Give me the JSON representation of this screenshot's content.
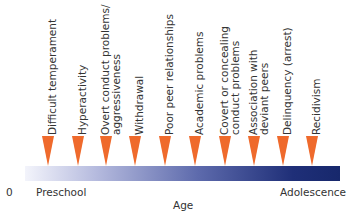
{
  "diagram": {
    "title": "",
    "events": [
      {
        "lines": [
          "Difficult temperament"
        ],
        "x": 48
      },
      {
        "lines": [
          "Hyperactivity"
        ],
        "x": 78
      },
      {
        "lines": [
          "Overt conduct problems/",
          "aggressiveness"
        ],
        "x": 106
      },
      {
        "lines": [
          "Withdrawal"
        ],
        "x": 135
      },
      {
        "lines": [
          "Poor peer relationships"
        ],
        "x": 165
      },
      {
        "lines": [
          "Academic problems"
        ],
        "x": 195
      },
      {
        "lines": [
          "Covert or concealing",
          "conduct problems"
        ],
        "x": 225
      },
      {
        "lines": [
          "Association with",
          "deviant peers"
        ],
        "x": 254
      },
      {
        "lines": [
          "Delinquency (arrest)"
        ],
        "x": 283
      },
      {
        "lines": [
          "Recidivism"
        ],
        "x": 312
      }
    ],
    "axis": {
      "origin": "0",
      "start_label": "Preschool",
      "end_label": "Adolescence",
      "title": "Age"
    },
    "colors": {
      "arrow": "#ef6a2c",
      "bar_start": "#f3f4fb",
      "bar_end": "#17286c"
    }
  }
}
